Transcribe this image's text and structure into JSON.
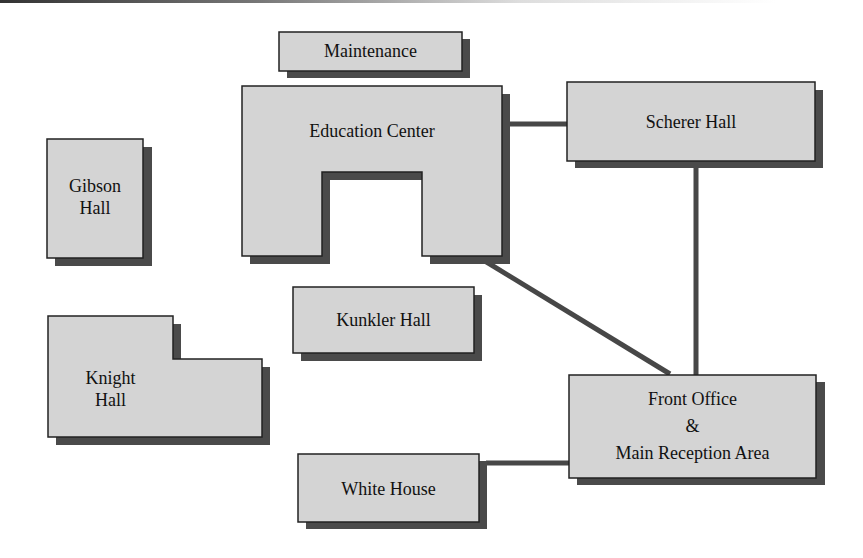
{
  "diagram": {
    "colors": {
      "fill": "#d4d4d4",
      "stroke": "#222222",
      "shadow": "#4a4a4a",
      "connector": "#474747"
    },
    "buildings": [
      {
        "id": "maintenance",
        "name": "Maintenance"
      },
      {
        "id": "education-center",
        "name": "Education Center"
      },
      {
        "id": "scherer-hall",
        "name": "Scherer Hall"
      },
      {
        "id": "gibson-hall",
        "name": "Gibson Hall",
        "lines": [
          "Gibson",
          "Hall"
        ]
      },
      {
        "id": "kunkler-hall",
        "name": "Kunkler Hall"
      },
      {
        "id": "knight-hall",
        "name": "Knight Hall",
        "lines": [
          "Knight",
          "Hall"
        ]
      },
      {
        "id": "front-office",
        "name": "Front Office & Main Reception Area",
        "lines": [
          "Front Office",
          "&",
          "Main Reception Area"
        ]
      },
      {
        "id": "white-house",
        "name": "White House"
      }
    ],
    "connections": [
      {
        "from": "Education Center",
        "to": "Scherer Hall"
      },
      {
        "from": "Scherer Hall",
        "to": "Front Office & Main Reception Area"
      },
      {
        "from": "Education Center",
        "to": "Front Office & Main Reception Area"
      },
      {
        "from": "White House",
        "to": "Front Office & Main Reception Area"
      }
    ]
  }
}
